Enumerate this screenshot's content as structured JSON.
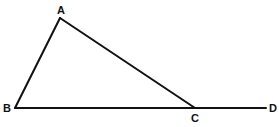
{
  "diagram": {
    "type": "geometry",
    "points": {
      "A": {
        "label": "A",
        "x": 60,
        "y": 18,
        "label_x": 61,
        "label_y": 14
      },
      "B": {
        "label": "B",
        "x": 15,
        "y": 108,
        "label_x": 7,
        "label_y": 112
      },
      "C": {
        "label": "C",
        "x": 195,
        "y": 108,
        "label_x": 195,
        "label_y": 122
      },
      "D": {
        "label": "D",
        "x": 266,
        "y": 108,
        "label_x": 273,
        "label_y": 112
      }
    },
    "segments": [
      {
        "name": "AB",
        "from": "A",
        "to": "B"
      },
      {
        "name": "AC",
        "from": "A",
        "to": "C"
      },
      {
        "name": "BD",
        "from": "B",
        "to": "D"
      }
    ],
    "colors": {
      "stroke": "#111111",
      "background": "#ffffff"
    }
  }
}
